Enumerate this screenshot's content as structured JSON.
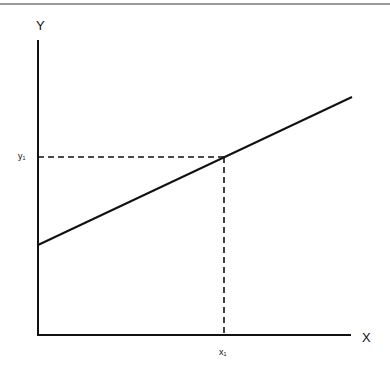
{
  "diagram": {
    "y_axis_label": "Y",
    "x_axis_label": "X",
    "y_marker_label": "y₁",
    "x_marker_label": "x₁",
    "line_color": "#111111",
    "top_border_color": "#9a9a9a"
  }
}
